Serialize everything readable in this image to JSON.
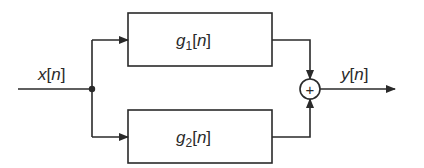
{
  "diagram": {
    "input": {
      "var": "x",
      "arg": "n",
      "label": "x[n]"
    },
    "output": {
      "var": "y",
      "arg": "n",
      "label": "y[n]"
    },
    "blocks": [
      {
        "id": "g1",
        "var": "g",
        "sub": "1",
        "arg": "n",
        "label": "g1[n]"
      },
      {
        "id": "g2",
        "var": "g",
        "sub": "2",
        "arg": "n",
        "label": "g2[n]"
      }
    ],
    "summing_junction": {
      "symbol": "+"
    },
    "colors": {
      "stroke": "#2a2a2a",
      "background": "#ffffff"
    }
  }
}
